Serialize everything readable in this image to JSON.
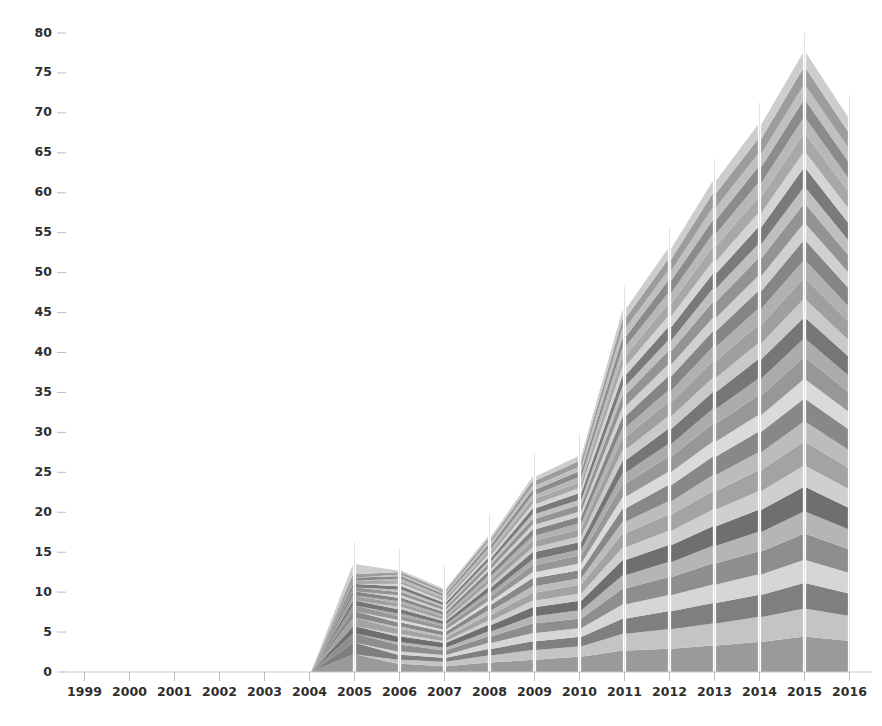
{
  "chart_data": {
    "type": "area",
    "title": "",
    "subtitle": "",
    "xlabel": "",
    "ylabel": "",
    "stacked": true,
    "grid": false,
    "legend": "none",
    "background": "#ffffff",
    "palette": [
      "#9a9a9a",
      "#c4c4c4",
      "#7f7f7f",
      "#d6d6d6",
      "#8e8e8e",
      "#b5b5b5",
      "#6f6f6f",
      "#cfcfcf",
      "#a3a3a3",
      "#bcbcbc",
      "#888888",
      "#dadada",
      "#979797",
      "#ababab",
      "#767676",
      "#c9c9c9",
      "#9f9f9f",
      "#b0b0b0",
      "#858585",
      "#d0d0d0",
      "#939393",
      "#bfbfbf",
      "#7a7a7a",
      "#d4d4d4",
      "#a8a8a8",
      "#b8b8b8",
      "#8b8b8b",
      "#c0c0c0",
      "#9c9c9c",
      "#cdcdcd"
    ],
    "ylim": [
      0,
      80
    ],
    "yticks": [
      0,
      5,
      10,
      15,
      20,
      25,
      30,
      35,
      40,
      45,
      50,
      55,
      60,
      65,
      70,
      75,
      80
    ],
    "ytick_labels": [
      "0",
      "5",
      "10",
      "15",
      "20",
      "25",
      "30",
      "35",
      "40",
      "45",
      "50",
      "55",
      "60",
      "65",
      "70",
      "75",
      "80"
    ],
    "x": [
      1999,
      2000,
      2001,
      2002,
      2003,
      2004,
      2005,
      2006,
      2007,
      2008,
      2009,
      2010,
      2011,
      2012,
      2013,
      2014,
      2015,
      2016
    ],
    "xtick_labels": [
      "1999",
      "2000",
      "2001",
      "2002",
      "2003",
      "2004",
      "2005",
      "2006",
      "2007",
      "2008",
      "2009",
      "2010",
      "2011",
      "2012",
      "2013",
      "2014",
      "2015",
      "2016"
    ],
    "totals": [
      0,
      0,
      0,
      0,
      0,
      0,
      13.5,
      12.7,
      10.5,
      17.0,
      24.5,
      27.0,
      45.5,
      53.0,
      61.5,
      68.5,
      77.5,
      69.5
    ],
    "series": [
      {
        "name": "S01",
        "values": [
          0,
          0,
          0,
          0,
          0,
          0,
          2.1,
          1.0,
          0.6,
          1.3,
          1.5,
          2.1,
          2.4,
          2.6,
          3.0,
          3.4,
          4.0,
          3.6
        ]
      },
      {
        "name": "S02",
        "values": [
          0,
          0,
          0,
          0,
          0,
          0,
          0.0,
          0.5,
          0.5,
          1.0,
          1.2,
          1.4,
          1.9,
          2.2,
          2.5,
          2.8,
          3.2,
          2.9
        ]
      },
      {
        "name": "S03",
        "values": [
          0,
          0,
          0,
          0,
          0,
          0,
          1.4,
          0.6,
          0.4,
          0.9,
          1.1,
          1.3,
          1.7,
          2.0,
          2.3,
          2.5,
          2.9,
          2.6
        ]
      },
      {
        "name": "S04",
        "values": [
          0,
          0,
          0,
          0,
          0,
          0,
          0.0,
          0.4,
          0.3,
          0.8,
          1.0,
          1.2,
          1.6,
          1.8,
          2.1,
          2.3,
          2.6,
          2.4
        ]
      },
      {
        "name": "S05",
        "values": [
          0,
          0,
          0,
          0,
          0,
          0,
          1.1,
          0.8,
          0.5,
          0.9,
          1.2,
          1.3,
          1.8,
          2.0,
          2.4,
          2.6,
          3.0,
          2.7
        ]
      },
      {
        "name": "S06",
        "values": [
          0,
          0,
          0,
          0,
          0,
          0,
          0.0,
          0.3,
          0.3,
          0.7,
          0.9,
          1.1,
          1.5,
          1.7,
          2.0,
          2.2,
          2.5,
          2.3
        ]
      },
      {
        "name": "S07",
        "values": [
          0,
          0,
          0,
          0,
          0,
          0,
          0.9,
          0.7,
          0.5,
          0.9,
          1.1,
          1.3,
          1.7,
          1.9,
          2.2,
          2.5,
          2.8,
          2.5
        ]
      },
      {
        "name": "S08",
        "values": [
          0,
          0,
          0,
          0,
          0,
          0,
          0.0,
          0.3,
          0.2,
          0.6,
          0.8,
          1.0,
          1.4,
          1.6,
          1.9,
          2.1,
          2.4,
          2.2
        ]
      },
      {
        "name": "S09",
        "values": [
          0,
          0,
          0,
          0,
          0,
          0,
          1.0,
          0.6,
          0.4,
          0.8,
          1.0,
          1.2,
          1.6,
          1.8,
          2.1,
          2.4,
          2.7,
          2.4
        ]
      },
      {
        "name": "S10",
        "values": [
          0,
          0,
          0,
          0,
          0,
          0,
          0.0,
          0.3,
          0.2,
          0.6,
          0.8,
          0.9,
          1.3,
          1.5,
          1.8,
          2.0,
          2.3,
          2.1
        ]
      },
      {
        "name": "S11",
        "values": [
          0,
          0,
          0,
          0,
          0,
          0,
          0.8,
          0.5,
          0.4,
          0.8,
          1.0,
          1.1,
          1.5,
          1.8,
          2.1,
          2.3,
          2.6,
          2.4
        ]
      },
      {
        "name": "S12",
        "values": [
          0,
          0,
          0,
          0,
          0,
          0,
          0.0,
          0.3,
          0.2,
          0.5,
          0.7,
          0.9,
          1.3,
          1.5,
          1.7,
          1.9,
          2.2,
          2.0
        ]
      },
      {
        "name": "S13",
        "values": [
          0,
          0,
          0,
          0,
          0,
          0,
          0.7,
          0.5,
          0.4,
          0.7,
          0.9,
          1.1,
          1.5,
          1.7,
          2.0,
          2.2,
          2.5,
          2.3
        ]
      },
      {
        "name": "S14",
        "values": [
          0,
          0,
          0,
          0,
          0,
          0,
          0.0,
          0.3,
          0.2,
          0.5,
          0.7,
          0.8,
          1.2,
          1.4,
          1.7,
          1.9,
          2.1,
          1.9
        ]
      },
      {
        "name": "S15",
        "values": [
          0,
          0,
          0,
          0,
          0,
          0,
          0.6,
          0.5,
          0.3,
          0.7,
          0.9,
          1.0,
          1.4,
          1.7,
          1.9,
          2.2,
          2.4,
          2.2
        ]
      },
      {
        "name": "S16",
        "values": [
          0,
          0,
          0,
          0,
          0,
          0,
          0.0,
          0.3,
          0.2,
          0.5,
          0.6,
          0.8,
          1.2,
          1.4,
          1.6,
          1.8,
          2.1,
          1.9
        ]
      },
      {
        "name": "S17",
        "values": [
          0,
          0,
          0,
          0,
          0,
          0,
          0.6,
          0.4,
          0.3,
          0.6,
          0.8,
          1.0,
          1.4,
          1.6,
          1.9,
          2.1,
          2.4,
          2.1
        ]
      },
      {
        "name": "S18",
        "values": [
          0,
          0,
          0,
          0,
          0,
          0,
          0.0,
          0.3,
          0.2,
          0.5,
          0.6,
          0.8,
          1.1,
          1.3,
          1.6,
          1.8,
          2.0,
          1.8
        ]
      },
      {
        "name": "S19",
        "values": [
          0,
          0,
          0,
          0,
          0,
          0,
          0.5,
          0.4,
          0.3,
          0.6,
          0.8,
          0.9,
          1.3,
          1.6,
          1.8,
          2.0,
          2.3,
          2.1
        ]
      },
      {
        "name": "S20",
        "values": [
          0,
          0,
          0,
          0,
          0,
          0,
          0.0,
          0.3,
          0.2,
          0.4,
          0.6,
          0.7,
          1.1,
          1.3,
          1.5,
          1.7,
          1.9,
          1.8
        ]
      },
      {
        "name": "S21",
        "values": [
          0,
          0,
          0,
          0,
          0,
          0,
          0.5,
          0.4,
          0.3,
          0.6,
          0.7,
          0.9,
          1.3,
          1.5,
          1.8,
          2.0,
          2.2,
          2.0
        ]
      },
      {
        "name": "S22",
        "values": [
          0,
          0,
          0,
          0,
          0,
          0,
          0.0,
          0.3,
          0.2,
          0.4,
          0.6,
          0.7,
          1.0,
          1.2,
          1.5,
          1.6,
          1.9,
          1.7
        ]
      },
      {
        "name": "S23",
        "values": [
          0,
          0,
          0,
          0,
          0,
          0,
          0.4,
          0.4,
          0.3,
          0.5,
          0.7,
          0.9,
          1.2,
          1.5,
          1.7,
          1.9,
          2.2,
          2.0
        ]
      },
      {
        "name": "S24",
        "values": [
          0,
          0,
          0,
          0,
          0,
          0,
          0.0,
          0.3,
          0.2,
          0.4,
          0.5,
          0.7,
          1.0,
          1.2,
          1.4,
          1.6,
          1.8,
          1.7
        ]
      },
      {
        "name": "S25",
        "values": [
          0,
          0,
          0,
          0,
          0,
          0,
          0.4,
          0.3,
          0.3,
          0.5,
          0.7,
          0.8,
          1.2,
          1.4,
          1.7,
          1.8,
          2.1,
          1.9
        ]
      },
      {
        "name": "S26",
        "values": [
          0,
          0,
          0,
          0,
          0,
          0,
          0.0,
          0.3,
          0.2,
          0.4,
          0.5,
          0.7,
          1.0,
          1.2,
          1.4,
          1.6,
          1.8,
          1.6
        ]
      },
      {
        "name": "S27",
        "values": [
          0,
          0,
          0,
          0,
          0,
          0,
          0.4,
          0.3,
          0.2,
          0.5,
          0.6,
          0.8,
          1.1,
          1.4,
          1.6,
          1.8,
          2.0,
          1.9
        ]
      },
      {
        "name": "S28",
        "values": [
          0,
          0,
          0,
          0,
          0,
          0,
          0.0,
          0.2,
          0.2,
          0.4,
          0.5,
          0.6,
          1.0,
          1.1,
          1.4,
          1.5,
          1.7,
          1.6
        ]
      },
      {
        "name": "S29",
        "values": [
          0,
          0,
          0,
          0,
          0,
          0,
          0.4,
          0.3,
          0.2,
          0.4,
          0.6,
          0.8,
          1.1,
          1.3,
          1.6,
          1.7,
          2.0,
          1.8
        ]
      },
      {
        "name": "S30",
        "values": [
          0,
          0,
          0,
          0,
          0,
          0,
          1.2,
          0.2,
          0.2,
          0.4,
          0.5,
          0.7,
          1.0,
          1.2,
          1.4,
          1.6,
          1.8,
          1.7
        ]
      }
    ],
    "annotations": [
      {
        "text": "peak",
        "x": 2015,
        "y": 77.5
      },
      {
        "text": "dip",
        "x": 2014,
        "y": 68.5
      },
      {
        "text": "data-start",
        "x": 2005,
        "y": 13.5
      }
    ]
  }
}
